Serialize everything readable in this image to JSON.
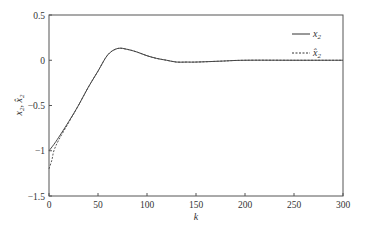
{
  "chart_data": {
    "type": "line",
    "title": "",
    "xlabel": "k",
    "ylabel": "x2, x̂2",
    "xlim": [
      0,
      300
    ],
    "ylim": [
      -1.5,
      0.5
    ],
    "xticks": [
      0,
      50,
      100,
      150,
      200,
      250,
      300
    ],
    "yticks": [
      0.5,
      0,
      -0.5,
      -1,
      -1.5
    ],
    "xtick_labels": [
      "0",
      "50",
      "100",
      "150",
      "200",
      "250",
      "300"
    ],
    "ytick_labels": [
      "0.5",
      "0",
      "−0.5",
      "−1",
      "−1.5"
    ],
    "grid": false,
    "legend_position": "upper right",
    "series": [
      {
        "name": "x2",
        "style": "solid",
        "x": [
          0,
          5,
          10,
          20,
          30,
          40,
          50,
          60,
          70,
          80,
          90,
          100,
          110,
          120,
          130,
          140,
          150,
          175,
          200,
          250,
          300
        ],
        "values": [
          -1.0,
          -0.93,
          -0.85,
          -0.68,
          -0.5,
          -0.3,
          -0.12,
          0.06,
          0.13,
          0.12,
          0.09,
          0.05,
          0.02,
          0.0,
          -0.02,
          -0.02,
          -0.02,
          -0.01,
          0.0,
          0.0,
          0.0
        ]
      },
      {
        "name": "x̂2",
        "style": "dashed",
        "x": [
          0,
          3,
          5,
          10,
          20,
          30,
          40,
          50,
          60,
          70,
          80,
          90,
          100,
          110,
          120,
          130,
          140,
          150,
          175,
          200,
          250,
          300
        ],
        "values": [
          -1.2,
          -1.1,
          -1.0,
          -0.88,
          -0.69,
          -0.5,
          -0.3,
          -0.12,
          0.06,
          0.13,
          0.12,
          0.09,
          0.05,
          0.02,
          0.0,
          -0.02,
          -0.02,
          -0.02,
          -0.01,
          0.0,
          0.0,
          0.0
        ]
      }
    ]
  },
  "legend": {
    "items": [
      {
        "label": "x",
        "sub": "2",
        "style": "solid"
      },
      {
        "label": "x̂",
        "sub": "2",
        "style": "dashed"
      }
    ]
  },
  "axes": {
    "xlabel": "k",
    "ylabel_main": "x",
    "ylabel_sub": "2",
    "ylabel_sep": ", ",
    "ylabel_hat": "x̂",
    "ylabel_hat_sub": "2"
  }
}
